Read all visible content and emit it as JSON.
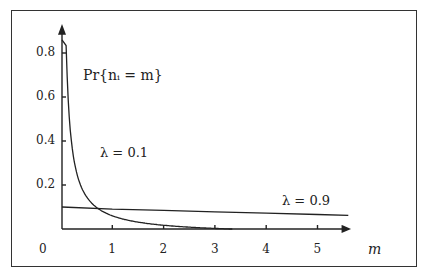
{
  "chart_data": {
    "type": "line",
    "title": "",
    "annotation": "Pr{n_i = m}",
    "xlabel": "m",
    "ylabel": "",
    "xlim": [
      0,
      5.6
    ],
    "ylim": [
      0,
      0.9
    ],
    "x_ticks": [
      "0",
      "1",
      "2",
      "3",
      "4",
      "5"
    ],
    "y_ticks": [
      "0.2",
      "0.4",
      "0.6",
      "0.8"
    ],
    "grid": false,
    "series": [
      {
        "name": "λ = 0.1",
        "x": [
          0.1,
          0.2,
          0.3,
          0.5,
          0.75,
          1.0,
          1.5,
          2.0,
          2.5,
          3.0,
          3.3
        ],
        "values": [
          0.86,
          0.45,
          0.34,
          0.2,
          0.13,
          0.09,
          0.055,
          0.035,
          0.015,
          0.006,
          0.0
        ]
      },
      {
        "name": "λ = 0.9",
        "x": [
          0,
          1,
          2,
          3,
          4,
          5,
          5.6
        ],
        "values": [
          0.1,
          0.09,
          0.085,
          0.078,
          0.072,
          0.066,
          0.062
        ]
      }
    ]
  },
  "labels": {
    "pr": "Pr{nᵢ = m}",
    "lambda1": "λ = 0.1",
    "lambda2": "λ = 0.9",
    "xaxis": "m",
    "origin": "0"
  }
}
